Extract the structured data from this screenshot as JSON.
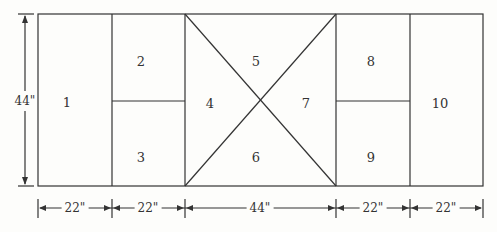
{
  "diagram": {
    "panels": [
      {
        "label": "1",
        "x": 67,
        "y": 102
      },
      {
        "label": "2",
        "x": 141,
        "y": 61
      },
      {
        "label": "3",
        "x": 141,
        "y": 157
      },
      {
        "label": "4",
        "x": 210,
        "y": 103
      },
      {
        "label": "5",
        "x": 256,
        "y": 61
      },
      {
        "label": "6",
        "x": 256,
        "y": 157
      },
      {
        "label": "7",
        "x": 306,
        "y": 103
      },
      {
        "label": "8",
        "x": 371,
        "y": 61
      },
      {
        "label": "9",
        "x": 371,
        "y": 157
      },
      {
        "label": "10",
        "x": 440,
        "y": 103
      }
    ],
    "height_label": "44\"",
    "widths": [
      "22\"",
      "22\"",
      "44\"",
      "22\"",
      "22\""
    ],
    "line_color": "#333333"
  }
}
